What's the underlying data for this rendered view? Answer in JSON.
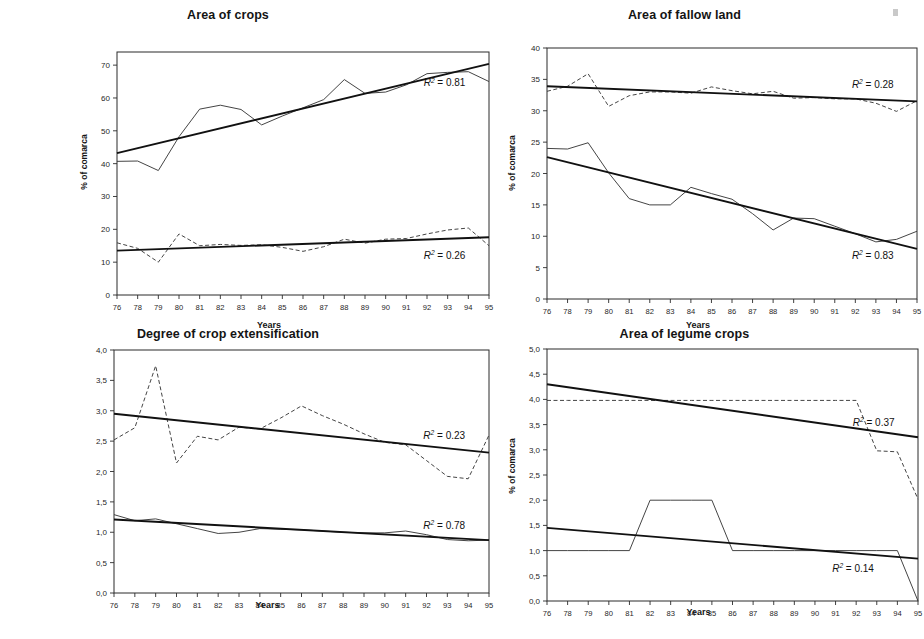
{
  "figure": {
    "panels": [
      "top-left",
      "top-right",
      "bottom-left",
      "bottom-right"
    ]
  },
  "chart_data": [
    {
      "id": "area-of-crops",
      "type": "line",
      "title": "Area of crops",
      "xlabel": "Years",
      "ylabel": "% of comarca",
      "xticks": [
        "76",
        "78",
        "79",
        "80",
        "81",
        "82",
        "83",
        "84",
        "85",
        "86",
        "87",
        "88",
        "89",
        "90",
        "91",
        "92",
        "93",
        "94",
        "95"
      ],
      "yticks": [
        "0",
        "10",
        "20",
        "30",
        "40",
        "50",
        "60",
        "70"
      ],
      "ylim": [
        0,
        74
      ],
      "ytick_values": [
        0,
        10,
        20,
        30,
        40,
        50,
        60,
        70
      ],
      "grid": false,
      "legend_position": "none",
      "series": [
        {
          "name": "upper-series",
          "style": "solid",
          "values": [
            40.7,
            40.8,
            37.9,
            48.2,
            56.6,
            57.8,
            56.5,
            51.8,
            54.5,
            57.0,
            59.5,
            65.6,
            61.4,
            61.8,
            64.0,
            67.4,
            67.8,
            68.0,
            65.0
          ]
        },
        {
          "name": "lower-series",
          "style": "dashed",
          "values": [
            15.9,
            14.2,
            10.0,
            18.6,
            15.0,
            15.4,
            15.1,
            15.3,
            14.5,
            13.3,
            14.7,
            17.0,
            15.8,
            17.0,
            17.2,
            18.6,
            19.8,
            20.4,
            15.0
          ]
        }
      ],
      "trends": [
        {
          "name": "upper-trend",
          "for_series": "upper-series",
          "y_start": 43.2,
          "y_end": 70.4,
          "r2_label": "R² = 0.81",
          "r2_value": 0.81,
          "r2_x_year": "93",
          "r2_y": 63.5
        },
        {
          "name": "lower-trend",
          "for_series": "lower-series",
          "y_start": 13.5,
          "y_end": 17.6,
          "r2_label": "R² = 0.26",
          "r2_value": 0.26,
          "r2_x_year": "93",
          "r2_y": 11.0
        }
      ]
    },
    {
      "id": "area-of-fallow-land",
      "type": "line",
      "title": "Area of fallow land",
      "xlabel": "Years",
      "ylabel": "% of comarca",
      "xticks": [
        "76",
        "78",
        "79",
        "80",
        "81",
        "82",
        "83",
        "84",
        "85",
        "86",
        "87",
        "88",
        "89",
        "90",
        "91",
        "92",
        "93",
        "94",
        "95"
      ],
      "yticks": [
        "0",
        "5",
        "10",
        "15",
        "20",
        "25",
        "30",
        "35",
        "40"
      ],
      "ylim": [
        0,
        40
      ],
      "ytick_values": [
        0,
        5,
        10,
        15,
        20,
        25,
        30,
        35,
        40
      ],
      "grid": false,
      "legend_position": "none",
      "series": [
        {
          "name": "upper-series",
          "style": "dashed",
          "values": [
            33.1,
            33.9,
            35.9,
            30.7,
            32.4,
            33.0,
            33.0,
            32.8,
            33.8,
            33.2,
            32.7,
            33.1,
            32.0,
            32.1,
            31.9,
            31.9,
            31.2,
            29.9,
            31.6
          ]
        },
        {
          "name": "lower-series",
          "style": "solid",
          "values": [
            24.0,
            23.9,
            24.9,
            20.1,
            16.0,
            15.0,
            15.0,
            17.8,
            16.8,
            15.9,
            13.6,
            11.0,
            12.9,
            12.8,
            11.6,
            10.4,
            9.1,
            9.5,
            10.8
          ]
        }
      ],
      "trends": [
        {
          "name": "upper-trend",
          "for_series": "upper-series",
          "y_start": 33.9,
          "y_end": 31.5,
          "r2_label": "R² = 0.28",
          "r2_value": 0.28,
          "r2_x_year": "93",
          "r2_y": 33.7
        },
        {
          "name": "lower-trend",
          "for_series": "lower-series",
          "y_start": 22.6,
          "y_end": 8.0,
          "r2_label": "R² = 0.83",
          "r2_value": 0.83,
          "r2_x_year": "93",
          "r2_y": 6.4
        }
      ]
    },
    {
      "id": "degree-of-crop-extensification",
      "type": "line",
      "title": "Degree of crop extensification",
      "xlabel": "Years",
      "ylabel": "",
      "xticks": [
        "76",
        "78",
        "79",
        "80",
        "81",
        "82",
        "83",
        "84",
        "85",
        "86",
        "87",
        "88",
        "89",
        "90",
        "91",
        "92",
        "93",
        "94",
        "95"
      ],
      "yticks": [
        "0,0",
        "0,5",
        "1,0",
        "1,5",
        "2,0",
        "2,5",
        "3,0",
        "3,5",
        "4,0"
      ],
      "ylim": [
        0,
        4
      ],
      "ytick_values": [
        0,
        0.5,
        1.0,
        1.5,
        2.0,
        2.5,
        3.0,
        3.5,
        4.0
      ],
      "grid": false,
      "legend_position": "none",
      "series": [
        {
          "name": "upper-series",
          "style": "dashed",
          "values": [
            2.52,
            2.72,
            3.74,
            2.14,
            2.58,
            2.52,
            2.73,
            2.7,
            2.88,
            3.08,
            2.92,
            2.78,
            2.62,
            2.48,
            2.44,
            2.18,
            1.92,
            1.88,
            2.6
          ]
        },
        {
          "name": "lower-series",
          "style": "solid",
          "values": [
            1.29,
            1.19,
            1.22,
            1.14,
            1.06,
            0.98,
            1.0,
            1.06,
            1.05,
            1.04,
            1.02,
            1.0,
            0.99,
            0.99,
            1.02,
            0.96,
            0.88,
            0.86,
            0.87
          ]
        }
      ],
      "trends": [
        {
          "name": "upper-trend",
          "for_series": "upper-series",
          "y_start": 2.95,
          "y_end": 2.31,
          "r2_label": "R² = 0.23",
          "r2_value": 0.23,
          "r2_x_year": "93",
          "r2_y": 2.54
        },
        {
          "name": "lower-trend",
          "for_series": "lower-series",
          "y_start": 1.21,
          "y_end": 0.87,
          "r2_label": "R² = 0.78",
          "r2_value": 0.78,
          "r2_x_year": "93",
          "r2_y": 1.06
        }
      ]
    },
    {
      "id": "area-of-legume-crops",
      "type": "line",
      "title": "Area of legume crops",
      "xlabel": "Years",
      "ylabel": "% of comarca",
      "xticks": [
        "76",
        "78",
        "79",
        "80",
        "81",
        "82",
        "83",
        "84",
        "85",
        "86",
        "87",
        "88",
        "89",
        "90",
        "91",
        "92",
        "93",
        "94",
        "95"
      ],
      "yticks": [
        "0,0",
        "0,5",
        "1,0",
        "1,5",
        "2,0",
        "2,5",
        "3,0",
        "3,5",
        "4,0",
        "4,5",
        "5,0"
      ],
      "ylim": [
        0,
        5
      ],
      "ytick_values": [
        0,
        0.5,
        1.0,
        1.5,
        2.0,
        2.5,
        3.0,
        3.5,
        4.0,
        4.5,
        5.0
      ],
      "grid": false,
      "legend_position": "none",
      "series": [
        {
          "name": "upper-series",
          "style": "dashed",
          "values": [
            3.98,
            3.98,
            3.98,
            3.98,
            3.98,
            3.98,
            3.98,
            3.98,
            3.98,
            3.98,
            3.98,
            3.98,
            3.98,
            3.98,
            3.98,
            3.98,
            2.98,
            2.96,
            2.02
          ]
        },
        {
          "name": "lower-series",
          "style": "solid",
          "values": [
            1.0,
            1.0,
            1.0,
            1.0,
            1.0,
            2.0,
            2.0,
            2.0,
            2.0,
            1.0,
            1.0,
            1.0,
            1.0,
            1.0,
            1.0,
            1.0,
            1.0,
            1.0,
            0.0
          ]
        }
      ],
      "trends": [
        {
          "name": "upper-trend",
          "for_series": "upper-series",
          "y_start": 4.3,
          "y_end": 3.25,
          "r2_label": "R² = 0.37",
          "r2_value": 0.37,
          "r2_x_year": "93",
          "r2_y": 3.48
        },
        {
          "name": "lower-trend",
          "for_series": "lower-series",
          "y_start": 1.45,
          "y_end": 0.84,
          "r2_label": "R² = 0.14",
          "r2_value": 0.14,
          "r2_x_year": "92",
          "r2_y": 0.58
        }
      ]
    }
  ]
}
